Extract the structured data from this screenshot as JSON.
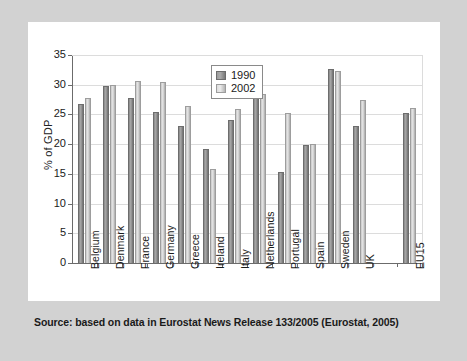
{
  "figure": {
    "source_note": "Source: based on data in Eurostat News Release 133/2005 (Eurostat, 2005)",
    "frame_color": "#d2d2d2",
    "panel_color": "#ffffff"
  },
  "chart_data": {
    "type": "bar",
    "title": "",
    "xlabel": "",
    "ylabel": "% of GDP",
    "ylim": [
      0,
      35
    ],
    "yticks": [
      0,
      5,
      10,
      15,
      20,
      25,
      30,
      35
    ],
    "grid": true,
    "legend_position": "top-center",
    "categories": [
      "Belgium",
      "Denmark",
      "France",
      "Germany",
      "Greece",
      "Ireland",
      "Italy",
      "Netherlands",
      "Portugal",
      "Spain",
      "Sweden",
      "UK",
      "",
      "EU15"
    ],
    "series": [
      {
        "name": "1990",
        "color": "#8d8d8d",
        "values": [
          26.7,
          29.7,
          27.7,
          25.4,
          23.0,
          19.1,
          24.0,
          32.4,
          15.3,
          19.8,
          32.7,
          23.0,
          null,
          25.2
        ]
      },
      {
        "name": "2002",
        "color": "#d9d9d9",
        "values": [
          27.8,
          30.0,
          30.6,
          30.5,
          26.5,
          15.9,
          25.9,
          28.4,
          25.3,
          20.0,
          32.3,
          27.4,
          null,
          26.0
        ]
      }
    ]
  }
}
